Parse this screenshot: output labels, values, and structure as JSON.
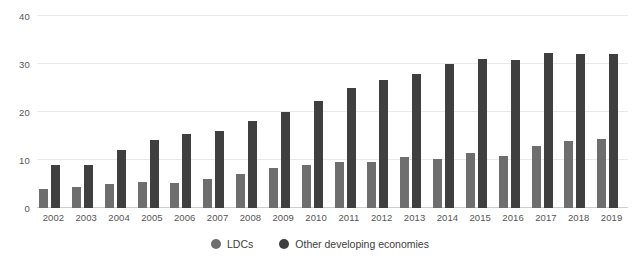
{
  "chart_data": {
    "type": "bar",
    "title": "",
    "subtitle": "",
    "xlabel": "",
    "ylabel": "",
    "ylim": [
      0,
      40
    ],
    "yticks": [
      0,
      10,
      20,
      30,
      40
    ],
    "grid": true,
    "legend_position": "bottom",
    "categories": [
      "2002",
      "2003",
      "2004",
      "2005",
      "2006",
      "2007",
      "2008",
      "2009",
      "2010",
      "2011",
      "2012",
      "2013",
      "2014",
      "2015",
      "2016",
      "2017",
      "2018",
      "2019"
    ],
    "series": [
      {
        "name": "LDCs",
        "color": "#6e6e6e",
        "values": [
          4,
          4.3,
          5,
          5.4,
          5.3,
          6,
          7,
          8.4,
          9,
          9.6,
          9.5,
          10.6,
          10.3,
          11.5,
          10.8,
          13,
          14,
          14.4
        ]
      },
      {
        "name": "Other developing economies",
        "color": "#3f3f3f",
        "values": [
          9,
          9,
          12,
          14.2,
          15.4,
          16.1,
          18.2,
          19.9,
          22.3,
          25,
          26.6,
          28,
          30.1,
          31,
          30.8,
          32.3,
          32,
          32.1
        ]
      }
    ]
  },
  "legend": {
    "items": [
      {
        "label": "LDCs",
        "color": "#6e6e6e",
        "swatch_icon": "circle-icon"
      },
      {
        "label": "Other developing economies",
        "color": "#3f3f3f",
        "swatch_icon": "circle-icon"
      }
    ]
  }
}
